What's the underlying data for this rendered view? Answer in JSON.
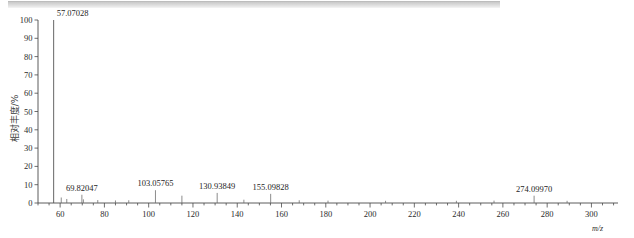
{
  "page": {
    "artifact_bar": "scanned-page-grey-bar"
  },
  "chart_data": {
    "type": "bar",
    "title": "",
    "xlabel": "m/z",
    "ylabel": "相对丰度/%",
    "xlim": [
      50,
      312
    ],
    "ylim": [
      0,
      100
    ],
    "grid": false,
    "legend": null,
    "x_ticks": [
      60,
      80,
      100,
      120,
      140,
      160,
      180,
      200,
      220,
      240,
      260,
      280,
      300
    ],
    "y_ticks": [
      0,
      10,
      20,
      30,
      40,
      50,
      60,
      70,
      80,
      90,
      100
    ],
    "x_tick_labels": [
      "60",
      "80",
      "100",
      "120",
      "140",
      "160",
      "180",
      "200",
      "220",
      "240",
      "260",
      "280",
      "300"
    ],
    "y_tick_labels": [
      "0",
      "10",
      "20",
      "30",
      "40",
      "50",
      "60",
      "70",
      "80",
      "90",
      "100"
    ],
    "x_minor_tick_step": 5,
    "labeled_peaks": [
      {
        "mz": 57.07028,
        "intensity": 100.0,
        "label": "57.07028"
      },
      {
        "mz": 69.82047,
        "intensity": 4.5,
        "label": "69.82047"
      },
      {
        "mz": 103.05765,
        "intensity": 7.0,
        "label": "103.05765"
      },
      {
        "mz": 130.93849,
        "intensity": 5.5,
        "label": "130.93849"
      },
      {
        "mz": 155.09828,
        "intensity": 5.0,
        "label": "155.09828"
      },
      {
        "mz": 274.0997,
        "intensity": 4.0,
        "label": "274.09970"
      }
    ],
    "minor_peaks": [
      {
        "mz": 60.5,
        "intensity": 3.0
      },
      {
        "mz": 63.0,
        "intensity": 2.2
      },
      {
        "mz": 70.5,
        "intensity": 2.0
      },
      {
        "mz": 77.0,
        "intensity": 1.6
      },
      {
        "mz": 85.0,
        "intensity": 1.4
      },
      {
        "mz": 91.0,
        "intensity": 1.5
      },
      {
        "mz": 115.0,
        "intensity": 4.0
      },
      {
        "mz": 143.0,
        "intensity": 1.8
      },
      {
        "mz": 168.0,
        "intensity": 1.5
      },
      {
        "mz": 181.0,
        "intensity": 1.3
      },
      {
        "mz": 207.0,
        "intensity": 1.2
      },
      {
        "mz": 239.0,
        "intensity": 1.2
      },
      {
        "mz": 256.0,
        "intensity": 1.3
      },
      {
        "mz": 289.0,
        "intensity": 1.2
      }
    ],
    "base_peak_mz": 57.07028,
    "base_peak_label": "57.07028"
  }
}
